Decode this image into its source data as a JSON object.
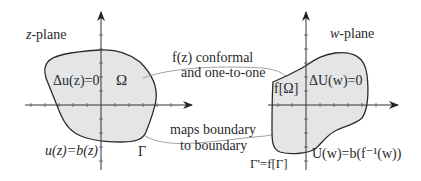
{
  "diagram": {
    "left_plane": {
      "title_var": "z",
      "title_suffix": "-plane",
      "laplace_eq": "Δu(z)=0",
      "region_label": "Ω",
      "boundary_label": "Γ",
      "boundary_condition": "u(z)=b(z)"
    },
    "right_plane": {
      "title_var": "w",
      "title_suffix": "-plane",
      "laplace_eq": "ΔU(w)=0",
      "region_label": "f[Ω]",
      "boundary_label": "Γ'=f[Γ]",
      "boundary_condition": "U(w)=b(f⁻¹(w))"
    },
    "arrows": {
      "top_line1": "f(z) conformal",
      "top_line2": "and one-to-one",
      "bottom_line1": "maps boundary",
      "bottom_line2": "to boundary"
    },
    "colors": {
      "region_fill": "#e3e5e7",
      "outline": "#2b2b2b",
      "connector": "#8a8a8a"
    }
  }
}
